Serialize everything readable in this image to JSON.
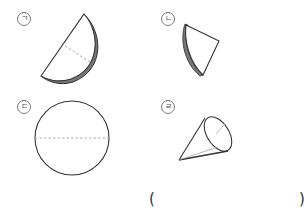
{
  "items": [
    {
      "marker": "㉠",
      "label_char": "ㄱ",
      "shape": "half-disc-folded",
      "description": "semicircle plate seen at an angle with dashed line"
    },
    {
      "marker": "㉡",
      "label_char": "ㄴ",
      "shape": "quarter-disc-folded",
      "description": "fan-shaped plate seen at an angle"
    },
    {
      "marker": "㉢",
      "label_char": "ㄷ",
      "shape": "circle",
      "description": "circle with dashed horizontal diameter"
    },
    {
      "marker": "㉣",
      "label_char": "ㄹ",
      "shape": "cone",
      "description": "cone with radius line on base"
    }
  ],
  "answer": {
    "open_paren": "(",
    "close_paren": ")",
    "value": ""
  },
  "colors": {
    "stroke": "#333333",
    "shadow": "#888888",
    "dashed": "#aaaaaa"
  }
}
